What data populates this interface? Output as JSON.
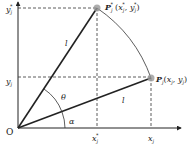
{
  "diagram": {
    "type": "rotation-geometry",
    "colors": {
      "line": "#222222",
      "dashed": "#333333",
      "point": "#9a9a9a",
      "background": "#ffffff"
    },
    "origin": {
      "label": "O"
    },
    "axes": {
      "x_ticks": [
        {
          "main": "x",
          "sub": "j",
          "sup": "*"
        },
        {
          "main": "x",
          "sub": "j",
          "sup": ""
        }
      ],
      "y_ticks": [
        {
          "main": "y",
          "sub": "j",
          "sup": "*"
        },
        {
          "main": "y",
          "sub": "j",
          "sup": ""
        }
      ]
    },
    "points": {
      "rotated": {
        "label_main": "P",
        "label_sub": "j",
        "label_sup": "*",
        "coords": "(xⱼ*, yⱼ*)",
        "coords_x": "x",
        "coords_y": "y"
      },
      "original": {
        "label_main": "P",
        "label_sub": "j",
        "coords_x": "x",
        "coords_y": "y"
      }
    },
    "segments": {
      "rotated_length": "l",
      "original_length": "l"
    },
    "angles": {
      "rotation": "θ",
      "initial": "α"
    }
  }
}
